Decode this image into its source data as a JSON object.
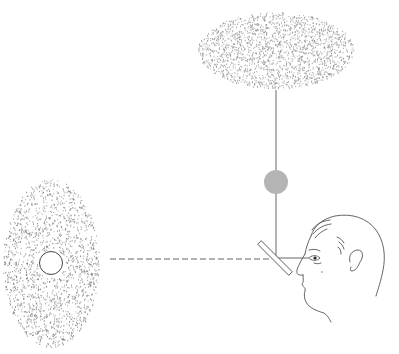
{
  "figure": {
    "background": "#ffffff",
    "ink_color": "#555555",
    "elements": {
      "top_field": {
        "label": "stippled-field-top",
        "dot_color": "#8a8a8a"
      },
      "left_field": {
        "label": "stippled-field-left",
        "dot_color": "#7a7a7a"
      },
      "white_disk": {
        "label": "white-disk-stimulus",
        "fill": "#ffffff",
        "stroke": "#444444"
      },
      "gray_disk": {
        "label": "gray-disk-stimulus",
        "fill": "#b4b4b4"
      },
      "mirror": {
        "label": "half-silvered-mirror"
      },
      "vertical_path": {
        "label": "vertical-light-path",
        "style": "solid"
      },
      "horizontal_path": {
        "label": "horizontal-light-path",
        "style": "dashed"
      },
      "observer": {
        "label": "observer-head-profile"
      }
    }
  }
}
